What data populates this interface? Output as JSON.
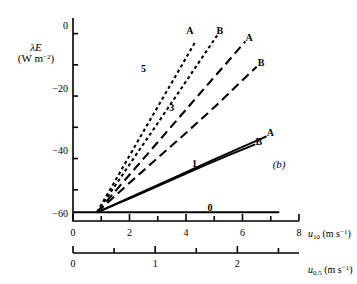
{
  "figure": {
    "panel_label": "(b)",
    "y_axis": {
      "symbol": "λE",
      "unit_line1": "(W m",
      "unit_exp": "−2",
      "unit_line2": ")",
      "ticks_major": [
        -60,
        -40,
        -20,
        0
      ],
      "tick_labels": [
        "−60",
        "−40",
        "−20",
        "0"
      ],
      "minor_step": 10,
      "range": [
        -62,
        3
      ]
    },
    "x_axis_primary": {
      "name_sym": "u",
      "name_sub": "10",
      "name_unit": "(m s",
      "name_exp": "−1",
      "name_unit_close": ")",
      "ticks_major": [
        0,
        2,
        4,
        6,
        8
      ],
      "tick_labels": [
        "0",
        "2",
        "4",
        "6",
        "8"
      ],
      "minor_step": 1,
      "range": [
        0,
        8
      ]
    },
    "x_axis_secondary": {
      "name_sym": "u",
      "name_sub": "0.5",
      "name_unit": "(m s",
      "name_exp": "−1",
      "name_unit_close": ")",
      "ticks_major": [
        0,
        1,
        2
      ],
      "tick_labels": [
        "0",
        "1",
        "2"
      ],
      "minor_step": 0.5,
      "range": [
        0,
        2.75
      ]
    }
  },
  "chart_data": {
    "type": "line",
    "title": "",
    "subtitle": "",
    "xlabel": "u10 (m s-1)",
    "ylabel": "λE (W m-2)",
    "xlim": [
      0,
      8
    ],
    "ylim": [
      -62,
      3
    ],
    "grid": false,
    "legend_position": "inline-end-labels",
    "panel": "(b)",
    "annotations": [
      {
        "text": "0",
        "x": 4.9,
        "y": -58.0,
        "role": "curve-group-label"
      },
      {
        "text": "1",
        "x": 4.35,
        "y": -44.0,
        "role": "curve-group-label"
      },
      {
        "text": "3",
        "x": 3.55,
        "y": -26.0,
        "role": "curve-group-label"
      },
      {
        "text": "5",
        "x": 2.55,
        "y": -13.5,
        "role": "curve-group-label"
      },
      {
        "text": "(b)",
        "x": 7.35,
        "y": -44.5,
        "role": "panel-label"
      }
    ],
    "common_origin": {
      "x": 0.85,
      "y": -59.2
    },
    "series": [
      {
        "name": "0",
        "group": "0",
        "style": "solid",
        "end_label": "",
        "x": [
          0.0,
          1.5,
          3.0,
          4.5,
          6.0,
          7.3
        ],
        "y": [
          -59.2,
          -59.2,
          -59.2,
          -59.2,
          -59.2,
          -59.2
        ]
      },
      {
        "name": "1B",
        "group": "1",
        "style": "solid",
        "end_label": "B",
        "x": [
          0.85,
          2.2,
          3.4,
          4.6,
          5.6,
          6.45
        ],
        "y": [
          -59.2,
          -54.0,
          -49.2,
          -44.4,
          -40.6,
          -37.5
        ]
      },
      {
        "name": "1A",
        "group": "1",
        "style": "solid",
        "end_label": "A",
        "x": [
          0.85,
          2.3,
          3.6,
          4.9,
          6.0,
          6.85
        ],
        "y": [
          -59.2,
          -53.3,
          -48.0,
          -42.7,
          -38.3,
          -34.9
        ]
      },
      {
        "name": "3B",
        "group": "3",
        "style": "long-dash",
        "end_label": "B",
        "x": [
          0.85,
          1.9,
          3.0,
          4.0,
          5.0,
          5.9,
          6.5
        ],
        "y": [
          -59.2,
          -50.6,
          -41.8,
          -33.8,
          -25.6,
          -17.8,
          -12.6
        ]
      },
      {
        "name": "3A",
        "group": "3",
        "style": "long-dash",
        "end_label": "A",
        "x": [
          0.85,
          1.75,
          2.7,
          3.6,
          4.5,
          5.4,
          6.1
        ],
        "y": [
          -59.2,
          -49.8,
          -39.9,
          -30.5,
          -21.1,
          -11.8,
          -4.5
        ]
      },
      {
        "name": "5B",
        "group": "5",
        "style": "short-dash",
        "end_label": "B",
        "x": [
          0.85,
          1.55,
          2.3,
          3.05,
          3.8,
          4.5,
          5.1
        ],
        "y": [
          -59.2,
          -49.9,
          -39.9,
          -30.0,
          -20.0,
          -10.6,
          -2.6
        ]
      },
      {
        "name": "5A",
        "group": "5",
        "style": "short-dash",
        "end_label": "A",
        "x": [
          0.85,
          1.45,
          2.1,
          2.75,
          3.4,
          4.0,
          4.35
        ],
        "y": [
          -59.2,
          -49.8,
          -39.5,
          -29.3,
          -19.2,
          -9.8,
          -4.3
        ]
      }
    ],
    "end_labels": [
      {
        "text": "B",
        "x": 6.6,
        "y": -37.0,
        "series": "1B"
      },
      {
        "text": "A",
        "x": 7.0,
        "y": -34.2,
        "series": "1A"
      },
      {
        "text": "B",
        "x": 6.68,
        "y": -11.6,
        "series": "3B"
      },
      {
        "text": "A",
        "x": 6.25,
        "y": -3.6,
        "series": "3A"
      },
      {
        "text": "B",
        "x": 5.22,
        "y": -1.4,
        "series": "5B"
      },
      {
        "text": "A",
        "x": 4.15,
        "y": -1.4,
        "series": "5A"
      }
    ]
  }
}
